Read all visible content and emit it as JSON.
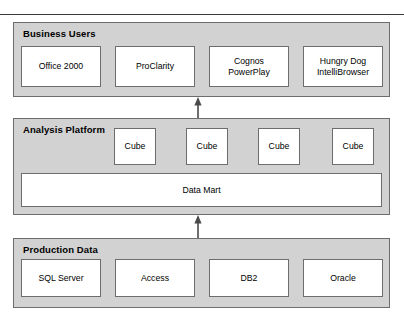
{
  "diagram": {
    "tiers": [
      {
        "id": "business-users",
        "label": "Business Users",
        "boxes": [
          {
            "line1": "Office 2000",
            "line2": ""
          },
          {
            "line1": "ProClarity",
            "line2": ""
          },
          {
            "line1": "Cognos",
            "line2": "PowerPlay"
          },
          {
            "line1": "Hungry Dog",
            "line2": "IntelliBrowser"
          }
        ]
      },
      {
        "id": "analysis-platform",
        "label": "Analysis Platform",
        "cubes": [
          {
            "line1": "Cube"
          },
          {
            "line1": "Cube"
          },
          {
            "line1": "Cube"
          },
          {
            "line1": "Cube"
          }
        ],
        "data_store": {
          "line1": "Data Mart"
        }
      },
      {
        "id": "production-data",
        "label": "Production Data",
        "boxes": [
          {
            "line1": "SQL Server",
            "line2": ""
          },
          {
            "line1": "Access",
            "line2": ""
          },
          {
            "line1": "DB2",
            "line2": ""
          },
          {
            "line1": "Oracle",
            "line2": ""
          }
        ]
      }
    ],
    "arrows": [
      {
        "name": "arrow-production-to-analysis",
        "direction": "up"
      },
      {
        "name": "arrow-analysis-to-business",
        "direction": "up"
      }
    ],
    "colors": {
      "panel_fill": "#d2d2d2",
      "box_fill": "#ffffff",
      "border": "#6d6d6d",
      "rule": "#3a3a3a",
      "text": "#000000"
    }
  }
}
